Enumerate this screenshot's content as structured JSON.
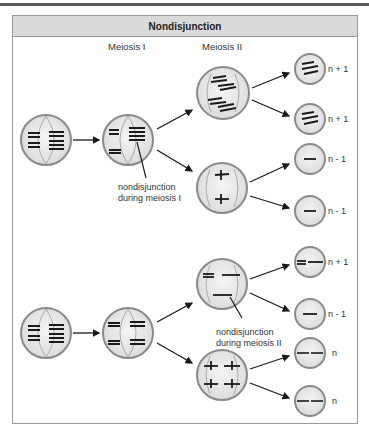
{
  "figure": {
    "title": "Nondisjunction",
    "stages": [
      {
        "label": "Meiosis I"
      },
      {
        "label": "Meiosis II"
      }
    ],
    "annotations": {
      "meiosis1": [
        "nondisjunction",
        "during meiosis I"
      ],
      "meiosis2": [
        "nondisjunction",
        "during meiosis II"
      ]
    },
    "rows": [
      {
        "name": "nondisjunction-meiosis-I",
        "gametes": [
          {
            "label": "n + 1"
          },
          {
            "label": "n + 1"
          },
          {
            "label": "n - 1"
          },
          {
            "label": "n - 1"
          }
        ]
      },
      {
        "name": "nondisjunction-meiosis-II",
        "gametes": [
          {
            "label": "n + 1"
          },
          {
            "label": "n - 1"
          },
          {
            "label": "n"
          },
          {
            "label": "n"
          }
        ]
      }
    ],
    "colors": {
      "cell_fill": "#e8e8e8",
      "cell_border": "#8a8a8a",
      "chromosome": "#1a1a1a",
      "header_bg": "#d9d9d9",
      "frame_border": "#9a9a9a"
    }
  }
}
